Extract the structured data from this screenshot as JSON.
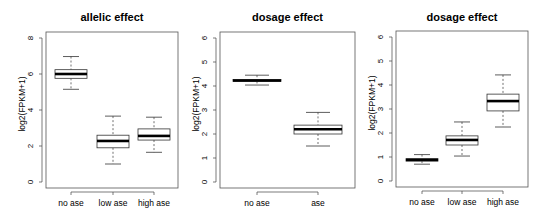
{
  "chart_data": [
    {
      "type": "box",
      "title": "allelic effect",
      "xlabel": "",
      "ylabel": "log2(FPKM+1)",
      "ylim": [
        0,
        8
      ],
      "yticks": [
        0,
        2,
        4,
        6,
        8
      ],
      "grid": false,
      "legend": null,
      "categories": [
        "no ase",
        "low ase",
        "high ase"
      ],
      "boxes": [
        {
          "category": "no ase",
          "whisker_low": 5.15,
          "q1": 5.76,
          "median": 6.0,
          "q3": 6.24,
          "whisker_high": 6.97
        },
        {
          "category": "low ase",
          "whisker_low": 1.0,
          "q1": 1.9,
          "median": 2.28,
          "q3": 2.6,
          "whisker_high": 3.66
        },
        {
          "category": "high ase",
          "whisker_low": 1.65,
          "q1": 2.33,
          "median": 2.56,
          "q3": 2.95,
          "whisker_high": 3.6
        }
      ],
      "layout": {
        "x0": 46,
        "x1": 178,
        "y_top": 32,
        "y_bottom": 188,
        "y_zero_px": 182,
        "px_per_unit": 18,
        "cat_x": [
          71,
          113,
          154
        ],
        "box_half": 16
      }
    },
    {
      "type": "box",
      "title": "dosage effect",
      "xlabel": "",
      "ylabel": "log2(FPKM+1)",
      "ylim": [
        0,
        6
      ],
      "yticks": [
        0,
        1,
        2,
        3,
        4,
        5,
        6
      ],
      "grid": false,
      "legend": null,
      "categories": [
        "no ase",
        "ase"
      ],
      "boxes": [
        {
          "category": "no ase",
          "whisker_low": 4.04,
          "q1": 4.19,
          "median": 4.23,
          "q3": 4.27,
          "whisker_high": 4.45
        },
        {
          "category": "ase",
          "whisker_low": 1.5,
          "q1": 2.0,
          "median": 2.2,
          "q3": 2.37,
          "whisker_high": 2.9
        }
      ],
      "layout": {
        "x0": 220,
        "x1": 355,
        "y_top": 32,
        "y_bottom": 188,
        "y_zero_px": 182,
        "px_per_unit": 24,
        "cat_x": [
          257,
          318
        ],
        "box_half": 24
      }
    },
    {
      "type": "box",
      "title": "dosage effect",
      "xlabel": "",
      "ylabel": "log2(FPKM+1)",
      "ylim": [
        0,
        6
      ],
      "yticks": [
        0,
        1,
        2,
        3,
        4,
        5,
        6
      ],
      "grid": false,
      "legend": null,
      "categories": [
        "no ase",
        "low ase",
        "high ase"
      ],
      "boxes": [
        {
          "category": "no ase",
          "whisker_low": 0.7,
          "q1": 0.83,
          "median": 0.88,
          "q3": 0.93,
          "whisker_high": 1.1
        },
        {
          "category": "low ase",
          "whisker_low": 1.04,
          "q1": 1.5,
          "median": 1.71,
          "q3": 1.88,
          "whisker_high": 2.46
        },
        {
          "category": "high ase",
          "whisker_low": 2.25,
          "q1": 2.92,
          "median": 3.33,
          "q3": 3.62,
          "whisker_high": 4.42
        }
      ],
      "layout": {
        "x0": 396,
        "x1": 528,
        "y_top": 31,
        "y_bottom": 187,
        "y_zero_px": 181,
        "px_per_unit": 24,
        "cat_x": [
          422,
          462,
          503
        ],
        "box_half": 16
      }
    }
  ]
}
